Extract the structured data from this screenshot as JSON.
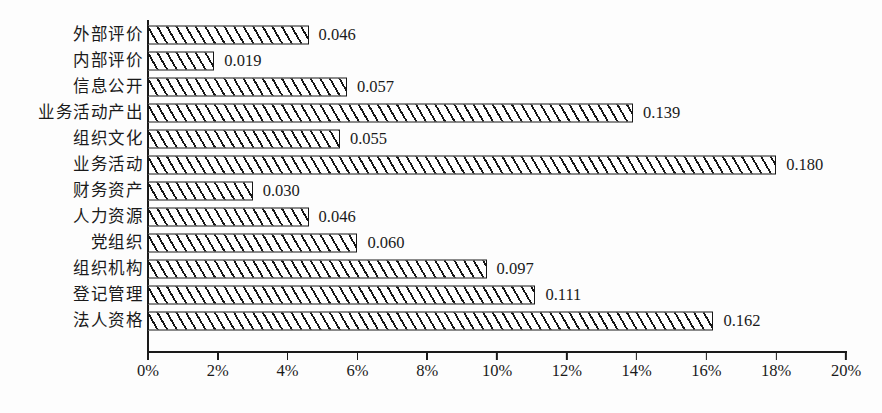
{
  "chart_data": {
    "type": "bar",
    "orientation": "horizontal",
    "title": "",
    "subtitle": "",
    "xlabel": "",
    "ylabel": "",
    "xlim": [
      0,
      0.2
    ],
    "xticks": [
      "0%",
      "2%",
      "4%",
      "6%",
      "8%",
      "10%",
      "12%",
      "14%",
      "16%",
      "18%",
      "20%"
    ],
    "xtick_values": [
      0,
      0.02,
      0.04,
      0.06,
      0.08,
      0.1,
      0.12,
      0.14,
      0.16,
      0.18,
      0.2
    ],
    "grid": false,
    "legend": null,
    "bar_style": "hatched-diagonal-black-on-white",
    "categories": [
      "外部评价",
      "内部评价",
      "信息公开",
      "业务活动产出",
      "组织文化",
      "业务活动",
      "财务资产",
      "人力资源",
      "党组织",
      "组织机构",
      "登记管理",
      "法人资格"
    ],
    "values": [
      0.046,
      0.019,
      0.057,
      0.139,
      0.055,
      0.18,
      0.03,
      0.046,
      0.06,
      0.097,
      0.111,
      0.162
    ],
    "value_labels": [
      "0.046",
      "0.019",
      "0.057",
      "0.139",
      "0.055",
      "0.180",
      "0.030",
      "0.046",
      "0.060",
      "0.097",
      "0.111",
      "0.162"
    ]
  }
}
